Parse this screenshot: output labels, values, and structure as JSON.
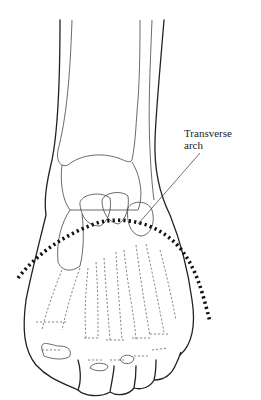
{
  "figure": {
    "labels": [
      {
        "id": "transverse-arch",
        "line1": "Transverse",
        "line2": "arch"
      }
    ],
    "arch_line_style": "dotted"
  }
}
